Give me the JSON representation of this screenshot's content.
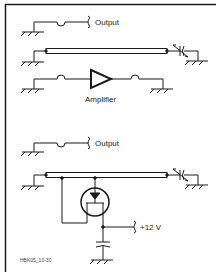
{
  "figure_id": "HBK05_10-30",
  "top_circuit": {
    "output_label": "Output",
    "amplifier_label": "Amplifier"
  },
  "bottom_circuit": {
    "output_label": "Output",
    "supply_label": "+12 V"
  },
  "colors": {
    "line": "#1a1a1a",
    "background": "#ffffff"
  }
}
